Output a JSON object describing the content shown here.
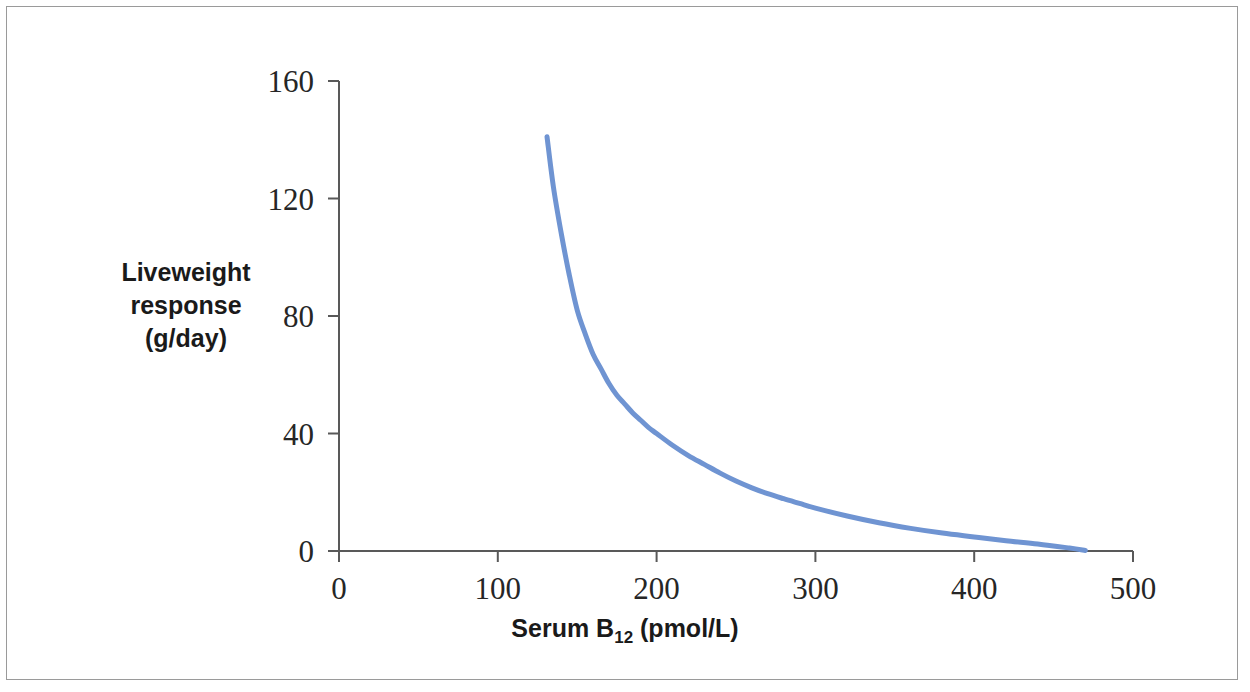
{
  "figure": {
    "background_color": "#ffffff",
    "border_color": "#9a9a9a"
  },
  "axes": {
    "x_title_prefix": "Serum B",
    "x_title_subscript": "12",
    "x_title_suffix": " (pmol/L)",
    "y_title_line1": "Liveweight",
    "y_title_line2": "response",
    "y_title_line3": "(g/day)",
    "axis_color": "#595959",
    "x_ticks": [
      "0",
      "100",
      "200",
      "300",
      "400",
      "500"
    ],
    "y_ticks": [
      "0",
      "40",
      "80",
      "120",
      "160"
    ]
  },
  "chart_data": {
    "type": "line",
    "title": "",
    "subtitle": "",
    "xlabel": "Serum B12 (pmol/L)",
    "ylabel": "Liveweight response (g/day)",
    "xlim": [
      0,
      500
    ],
    "ylim": [
      0,
      160
    ],
    "xticks": [
      0,
      100,
      200,
      300,
      400,
      500
    ],
    "yticks": [
      0,
      40,
      80,
      120,
      160
    ],
    "grid": false,
    "legend": false,
    "legend_position": "none",
    "series": [
      {
        "name": "Liveweight response",
        "color": "#6f94d2",
        "line_width": 5,
        "x": [
          131,
          135,
          140,
          145,
          150,
          155,
          160,
          165,
          170,
          175,
          180,
          185,
          190,
          195,
          200,
          210,
          220,
          230,
          240,
          250,
          260,
          270,
          280,
          290,
          300,
          320,
          340,
          360,
          380,
          400,
          420,
          440,
          460,
          470
        ],
        "y": [
          141,
          124,
          108,
          94,
          82,
          74,
          67,
          62,
          57,
          53,
          50,
          47,
          44.5,
          42,
          40,
          36,
          32.5,
          29.5,
          26.5,
          23.8,
          21.5,
          19.5,
          17.8,
          16.2,
          14.6,
          11.9,
          9.6,
          7.7,
          6.1,
          4.8,
          3.5,
          2.4,
          1.0,
          0.2
        ]
      }
    ],
    "annotations": []
  }
}
